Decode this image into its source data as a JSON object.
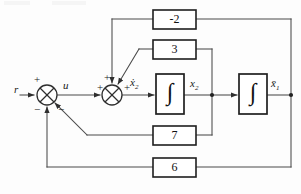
{
  "figure": {
    "type": "control-block-diagram",
    "title": "",
    "background_color": "#fdfdfd",
    "line_color": "#3a3a3a",
    "text_color": "#111111"
  },
  "signals": {
    "input": "r",
    "after_first_sum": "u",
    "x2_dot": "ẋ",
    "x2_dot_sub": "2",
    "x2": "x",
    "x2_sub": "2",
    "x1": "x̄",
    "x1_sub": "1"
  },
  "summing_junctions": [
    {
      "id": "sum-1",
      "name": "left-summing-junction",
      "cx": 47,
      "cy": 95,
      "r": 10,
      "signs": [
        {
          "label": "+",
          "position": "top-left",
          "x": 33,
          "y": 72
        },
        {
          "label": "−",
          "position": "bottom-left",
          "x": 33,
          "y": 104
        },
        {
          "label": "−",
          "position": "bottom-right",
          "x": 58,
          "y": 104
        }
      ]
    },
    {
      "id": "sum-2",
      "name": "right-summing-junction",
      "cx": 112,
      "cy": 95,
      "r": 10,
      "signs": [
        {
          "label": "+",
          "position": "left",
          "x": 97,
          "y": 85
        },
        {
          "label": "+",
          "position": "top",
          "x": 104,
          "y": 72
        },
        {
          "label": "+",
          "position": "right",
          "x": 125,
          "y": 85
        }
      ]
    }
  ],
  "gain_blocks": [
    {
      "id": "gain-minus2",
      "name": "gain-block-minus-2",
      "value": "-2",
      "x": 153,
      "y": 10,
      "w": 43,
      "h": 19
    },
    {
      "id": "gain-3",
      "name": "gain-block-3",
      "value": "3",
      "x": 153,
      "y": 40,
      "w": 43,
      "h": 19
    },
    {
      "id": "gain-7",
      "name": "gain-block-7",
      "value": "7",
      "x": 153,
      "y": 126,
      "w": 43,
      "h": 19
    },
    {
      "id": "gain-6",
      "name": "gain-block-6",
      "value": "6",
      "x": 153,
      "y": 158,
      "w": 43,
      "h": 19
    }
  ],
  "integrators": [
    {
      "id": "integrator-1",
      "name": "integrator-block-1",
      "symbol": "∫",
      "x": 156,
      "y": 74,
      "w": 28,
      "h": 40
    },
    {
      "id": "integrator-2",
      "name": "integrator-block-2",
      "symbol": "∫",
      "x": 239,
      "y": 74,
      "w": 28,
      "h": 40
    }
  ],
  "nodes": [
    {
      "id": "node-x2",
      "name": "branch-node-x2",
      "x": 212,
      "y": 95
    },
    {
      "id": "node-x1",
      "name": "branch-node-x1",
      "x": 291,
      "y": 95
    }
  ],
  "labels": {
    "r": {
      "text": "r",
      "x": 14,
      "y": 86
    },
    "u": {
      "text": "u",
      "x": 62,
      "y": 82
    },
    "x2dot": {
      "text": "x",
      "x": 131,
      "y": 80
    },
    "x2": {
      "text": "x",
      "x": 190,
      "y": 80
    },
    "x1": {
      "text": "x",
      "x": 272,
      "y": 80
    }
  },
  "feedback_paths": [
    {
      "from": "x1",
      "through": "gain-minus2",
      "to": "sum-2",
      "sign": "+"
    },
    {
      "from": "x2",
      "through": "gain-3",
      "to": "sum-2",
      "sign": "+"
    },
    {
      "from": "x2",
      "through": "gain-7",
      "to": "sum-1",
      "sign": "−"
    },
    {
      "from": "x1",
      "through": "gain-6",
      "to": "sum-1",
      "sign": "−"
    }
  ]
}
